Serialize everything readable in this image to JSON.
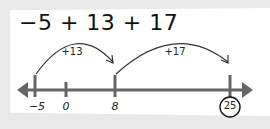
{
  "expression": "−5 + 13 + 17",
  "colors": {
    "axis": "#666666",
    "ink": "#222222",
    "background": "#e9e9e9",
    "paper": "#ffffff"
  },
  "number_line": {
    "ticks": [
      {
        "value": -5,
        "label": "−5",
        "x": 35
      },
      {
        "value": 0,
        "label": "0",
        "x": 66
      },
      {
        "value": 8,
        "label": "8",
        "x": 115
      },
      {
        "value": 25,
        "label": "25",
        "x": 230,
        "circled": true
      }
    ]
  },
  "jumps": [
    {
      "label": "+13",
      "from": -5,
      "to": 8
    },
    {
      "label": "+17",
      "from": 8,
      "to": 25
    }
  ],
  "result": "25"
}
